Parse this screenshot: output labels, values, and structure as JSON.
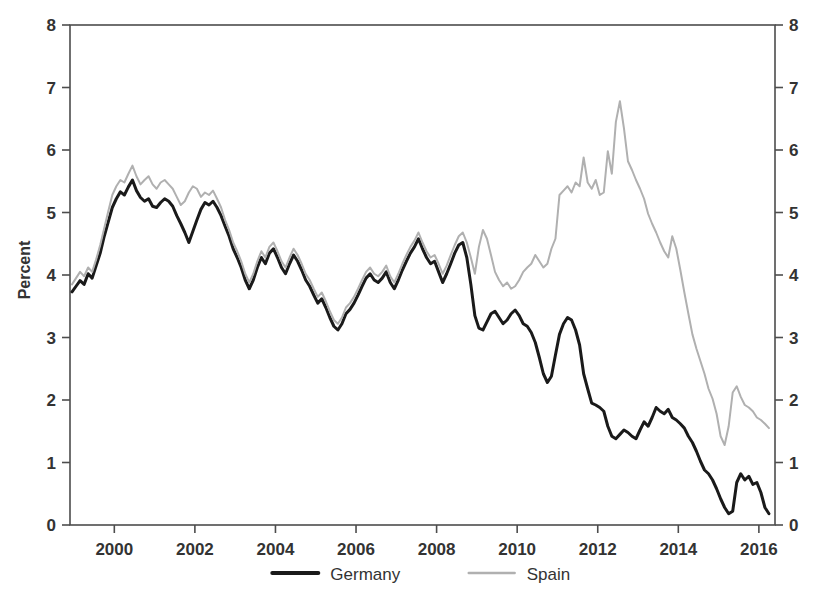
{
  "chart_data": {
    "type": "line",
    "title": "",
    "xlabel": "",
    "ylabel": "Percent",
    "xlim": [
      1998.9,
      2016.4
    ],
    "ylim": [
      0,
      8
    ],
    "grid": false,
    "legend_position": "bottom-center",
    "x_ticks": [
      "2000",
      "2002",
      "2004",
      "2006",
      "2008",
      "2010",
      "2012",
      "2014",
      "2016"
    ],
    "x_tick_values": [
      2000,
      2002,
      2004,
      2006,
      2008,
      2010,
      2012,
      2014,
      2016
    ],
    "y_ticks": [
      "0",
      "1",
      "2",
      "3",
      "4",
      "5",
      "6",
      "7",
      "8"
    ],
    "y_tick_values": [
      0,
      1,
      2,
      3,
      4,
      5,
      6,
      7,
      8
    ],
    "y_axis_right_mirrored": true,
    "series": [
      {
        "name": "Germany",
        "color": "#1a1a1a",
        "width": 3.0,
        "x": [
          1998.95,
          1999.05,
          1999.15,
          1999.25,
          1999.35,
          1999.45,
          1999.55,
          1999.65,
          1999.75,
          1999.85,
          1999.95,
          2000.05,
          2000.15,
          2000.25,
          2000.35,
          2000.45,
          2000.55,
          2000.65,
          2000.75,
          2000.85,
          2000.95,
          2001.05,
          2001.15,
          2001.25,
          2001.35,
          2001.45,
          2001.55,
          2001.65,
          2001.75,
          2001.85,
          2001.95,
          2002.05,
          2002.15,
          2002.25,
          2002.35,
          2002.45,
          2002.55,
          2002.65,
          2002.75,
          2002.85,
          2002.95,
          2003.05,
          2003.15,
          2003.25,
          2003.35,
          2003.45,
          2003.55,
          2003.65,
          2003.75,
          2003.85,
          2003.95,
          2004.05,
          2004.15,
          2004.25,
          2004.35,
          2004.45,
          2004.55,
          2004.65,
          2004.75,
          2004.85,
          2004.95,
          2005.05,
          2005.15,
          2005.25,
          2005.35,
          2005.45,
          2005.55,
          2005.65,
          2005.75,
          2005.85,
          2005.95,
          2006.05,
          2006.15,
          2006.25,
          2006.35,
          2006.45,
          2006.55,
          2006.65,
          2006.75,
          2006.85,
          2006.95,
          2007.05,
          2007.15,
          2007.25,
          2007.35,
          2007.45,
          2007.55,
          2007.65,
          2007.75,
          2007.85,
          2007.95,
          2008.05,
          2008.15,
          2008.25,
          2008.35,
          2008.45,
          2008.55,
          2008.65,
          2008.75,
          2008.85,
          2008.95,
          2009.05,
          2009.15,
          2009.25,
          2009.35,
          2009.45,
          2009.55,
          2009.65,
          2009.75,
          2009.85,
          2009.95,
          2010.05,
          2010.15,
          2010.25,
          2010.35,
          2010.45,
          2010.55,
          2010.65,
          2010.75,
          2010.85,
          2010.95,
          2011.05,
          2011.15,
          2011.25,
          2011.35,
          2011.45,
          2011.55,
          2011.65,
          2011.75,
          2011.85,
          2011.95,
          2012.05,
          2012.15,
          2012.25,
          2012.35,
          2012.45,
          2012.55,
          2012.65,
          2012.75,
          2012.85,
          2012.95,
          2013.05,
          2013.15,
          2013.25,
          2013.35,
          2013.45,
          2013.55,
          2013.65,
          2013.75,
          2013.85,
          2013.95,
          2014.05,
          2014.15,
          2014.25,
          2014.35,
          2014.45,
          2014.55,
          2014.65,
          2014.75,
          2014.85,
          2014.95,
          2015.05,
          2015.15,
          2015.25,
          2015.35,
          2015.45,
          2015.55,
          2015.65,
          2015.75,
          2015.85,
          2015.95,
          2016.05,
          2016.15,
          2016.25
        ],
        "values": [
          3.73,
          3.82,
          3.91,
          3.85,
          4.02,
          3.95,
          4.15,
          4.35,
          4.62,
          4.85,
          5.08,
          5.22,
          5.33,
          5.28,
          5.41,
          5.52,
          5.35,
          5.24,
          5.18,
          5.22,
          5.1,
          5.08,
          5.16,
          5.22,
          5.18,
          5.1,
          4.95,
          4.82,
          4.68,
          4.52,
          4.7,
          4.88,
          5.05,
          5.16,
          5.12,
          5.18,
          5.08,
          4.95,
          4.78,
          4.62,
          4.42,
          4.28,
          4.12,
          3.92,
          3.78,
          3.92,
          4.12,
          4.28,
          4.18,
          4.35,
          4.42,
          4.28,
          4.12,
          4.02,
          4.18,
          4.32,
          4.22,
          4.08,
          3.92,
          3.82,
          3.68,
          3.55,
          3.62,
          3.48,
          3.32,
          3.18,
          3.12,
          3.22,
          3.38,
          3.45,
          3.55,
          3.68,
          3.82,
          3.95,
          4.02,
          3.92,
          3.88,
          3.95,
          4.05,
          3.88,
          3.78,
          3.92,
          4.08,
          4.22,
          4.35,
          4.45,
          4.58,
          4.42,
          4.28,
          4.18,
          4.22,
          4.05,
          3.88,
          4.02,
          4.18,
          4.35,
          4.48,
          4.52,
          4.28,
          3.85,
          3.35,
          3.15,
          3.12,
          3.25,
          3.38,
          3.42,
          3.32,
          3.22,
          3.28,
          3.38,
          3.44,
          3.35,
          3.22,
          3.18,
          3.08,
          2.92,
          2.68,
          2.42,
          2.28,
          2.38,
          2.72,
          3.05,
          3.22,
          3.32,
          3.28,
          3.12,
          2.88,
          2.42,
          2.18,
          1.95,
          1.92,
          1.88,
          1.82,
          1.58,
          1.42,
          1.38,
          1.45,
          1.52,
          1.48,
          1.42,
          1.38,
          1.52,
          1.65,
          1.58,
          1.72,
          1.88,
          1.82,
          1.78,
          1.85,
          1.72,
          1.68,
          1.62,
          1.55,
          1.42,
          1.32,
          1.18,
          1.02,
          0.88,
          0.82,
          0.72,
          0.58,
          0.42,
          0.28,
          0.18,
          0.22,
          0.68,
          0.82,
          0.72,
          0.78,
          0.65,
          0.68,
          0.52,
          0.28,
          0.18
        ]
      },
      {
        "name": "Spain",
        "color": "#b0b0b0",
        "width": 2.0,
        "x": [
          1998.95,
          1999.05,
          1999.15,
          1999.25,
          1999.35,
          1999.45,
          1999.55,
          1999.65,
          1999.75,
          1999.85,
          1999.95,
          2000.05,
          2000.15,
          2000.25,
          2000.35,
          2000.45,
          2000.55,
          2000.65,
          2000.75,
          2000.85,
          2000.95,
          2001.05,
          2001.15,
          2001.25,
          2001.35,
          2001.45,
          2001.55,
          2001.65,
          2001.75,
          2001.85,
          2001.95,
          2002.05,
          2002.15,
          2002.25,
          2002.35,
          2002.45,
          2002.55,
          2002.65,
          2002.75,
          2002.85,
          2002.95,
          2003.05,
          2003.15,
          2003.25,
          2003.35,
          2003.45,
          2003.55,
          2003.65,
          2003.75,
          2003.85,
          2003.95,
          2004.05,
          2004.15,
          2004.25,
          2004.35,
          2004.45,
          2004.55,
          2004.65,
          2004.75,
          2004.85,
          2004.95,
          2005.05,
          2005.15,
          2005.25,
          2005.35,
          2005.45,
          2005.55,
          2005.65,
          2005.75,
          2005.85,
          2005.95,
          2006.05,
          2006.15,
          2006.25,
          2006.35,
          2006.45,
          2006.55,
          2006.65,
          2006.75,
          2006.85,
          2006.95,
          2007.05,
          2007.15,
          2007.25,
          2007.35,
          2007.45,
          2007.55,
          2007.65,
          2007.75,
          2007.85,
          2007.95,
          2008.05,
          2008.15,
          2008.25,
          2008.35,
          2008.45,
          2008.55,
          2008.65,
          2008.75,
          2008.85,
          2008.95,
          2009.05,
          2009.15,
          2009.25,
          2009.35,
          2009.45,
          2009.55,
          2009.65,
          2009.75,
          2009.85,
          2009.95,
          2010.05,
          2010.15,
          2010.25,
          2010.35,
          2010.45,
          2010.55,
          2010.65,
          2010.75,
          2010.85,
          2010.95,
          2011.05,
          2011.15,
          2011.25,
          2011.35,
          2011.45,
          2011.55,
          2011.65,
          2011.75,
          2011.85,
          2011.95,
          2012.05,
          2012.15,
          2012.25,
          2012.35,
          2012.45,
          2012.55,
          2012.65,
          2012.75,
          2012.85,
          2012.95,
          2013.05,
          2013.15,
          2013.25,
          2013.35,
          2013.45,
          2013.55,
          2013.65,
          2013.75,
          2013.85,
          2013.95,
          2014.05,
          2014.15,
          2014.25,
          2014.35,
          2014.45,
          2014.55,
          2014.65,
          2014.75,
          2014.85,
          2014.95,
          2015.05,
          2015.15,
          2015.25,
          2015.35,
          2015.45,
          2015.55,
          2015.65,
          2015.75,
          2015.85,
          2015.95,
          2016.05,
          2016.15,
          2016.25
        ],
        "values": [
          3.85,
          3.95,
          4.05,
          3.98,
          4.12,
          4.05,
          4.25,
          4.48,
          4.75,
          5.02,
          5.28,
          5.42,
          5.52,
          5.48,
          5.62,
          5.75,
          5.58,
          5.45,
          5.52,
          5.58,
          5.45,
          5.38,
          5.48,
          5.52,
          5.45,
          5.38,
          5.25,
          5.12,
          5.18,
          5.32,
          5.42,
          5.38,
          5.25,
          5.32,
          5.28,
          5.35,
          5.22,
          5.08,
          4.88,
          4.72,
          4.52,
          4.38,
          4.22,
          4.02,
          3.88,
          4.02,
          4.22,
          4.38,
          4.28,
          4.45,
          4.52,
          4.38,
          4.22,
          4.12,
          4.28,
          4.42,
          4.32,
          4.18,
          4.02,
          3.92,
          3.78,
          3.65,
          3.72,
          3.58,
          3.42,
          3.28,
          3.22,
          3.32,
          3.48,
          3.55,
          3.65,
          3.78,
          3.92,
          4.05,
          4.12,
          4.02,
          3.98,
          4.05,
          4.15,
          3.98,
          3.88,
          4.02,
          4.18,
          4.32,
          4.45,
          4.55,
          4.68,
          4.52,
          4.38,
          4.28,
          4.32,
          4.18,
          4.02,
          4.15,
          4.32,
          4.48,
          4.62,
          4.68,
          4.52,
          4.28,
          4.02,
          4.45,
          4.72,
          4.58,
          4.32,
          4.05,
          3.92,
          3.82,
          3.88,
          3.78,
          3.82,
          3.92,
          4.05,
          4.12,
          4.18,
          4.32,
          4.22,
          4.12,
          4.18,
          4.42,
          4.58,
          5.28,
          5.35,
          5.42,
          5.32,
          5.48,
          5.42,
          5.88,
          5.48,
          5.38,
          5.52,
          5.28,
          5.32,
          5.98,
          5.62,
          6.45,
          6.78,
          6.35,
          5.82,
          5.68,
          5.52,
          5.38,
          5.22,
          4.98,
          4.82,
          4.68,
          4.52,
          4.38,
          4.28,
          4.62,
          4.42,
          4.08,
          3.72,
          3.38,
          3.05,
          2.82,
          2.62,
          2.42,
          2.18,
          2.02,
          1.78,
          1.42,
          1.28,
          1.58,
          2.12,
          2.22,
          2.05,
          1.92,
          1.88,
          1.82,
          1.72,
          1.68,
          1.62,
          1.55
        ]
      }
    ]
  },
  "axis": {
    "y_label": "Percent"
  },
  "legend": {
    "entries": [
      {
        "label": "Germany",
        "color": "#1a1a1a",
        "width": 4
      },
      {
        "label": "Spain",
        "color": "#b0b0b0",
        "width": 2.4
      }
    ]
  }
}
